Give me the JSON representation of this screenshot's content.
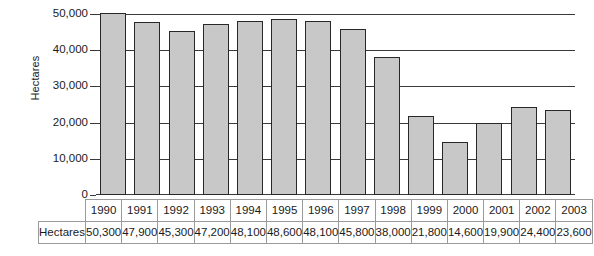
{
  "chart_data": {
    "type": "bar",
    "title": "",
    "xlabel": "",
    "ylabel": "Hectares",
    "ylim": [
      0,
      50000
    ],
    "yticks": [
      0,
      10000,
      20000,
      30000,
      40000,
      50000
    ],
    "ytick_labels": [
      "0",
      "10,000",
      "20,000",
      "30,000",
      "40,000",
      "50,000"
    ],
    "grid": true,
    "legend": false,
    "categories": [
      "1990",
      "1991",
      "1992",
      "1993",
      "1994",
      "1995",
      "1996",
      "1997",
      "1998",
      "1999",
      "2000",
      "2001",
      "2002",
      "2003"
    ],
    "values": [
      50300,
      47900,
      45300,
      47200,
      48100,
      48600,
      48100,
      45800,
      38000,
      21800,
      14600,
      19900,
      24400,
      23600
    ],
    "value_labels": [
      "50,300",
      "47,900",
      "45,300",
      "47,200",
      "48,100",
      "48,600",
      "48,100",
      "45,800",
      "38,000",
      "21,800",
      "14,600",
      "19,900",
      "24,400",
      "23,600"
    ],
    "bar_color": "#c8c8c8",
    "bar_edge_color": "#282828",
    "axis_color": "#3a3a3a"
  },
  "table": {
    "row_label": "Hectares",
    "header_row": [
      "1990",
      "1991",
      "1992",
      "1993",
      "1994",
      "1995",
      "1996",
      "1997",
      "1998",
      "1999",
      "2000",
      "2001",
      "2002",
      "2003"
    ],
    "value_row": [
      "50,300",
      "47,900",
      "45,300",
      "47,200",
      "48,100",
      "48,600",
      "48,100",
      "45,800",
      "38,000",
      "21,800",
      "14,600",
      "19,900",
      "24,400",
      "23,600"
    ]
  }
}
